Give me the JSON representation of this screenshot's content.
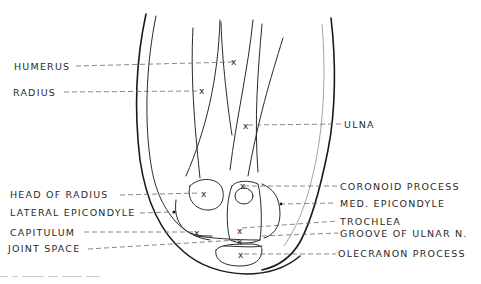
{
  "figure": {
    "type": "anatomical line drawing"
  },
  "labels_left": [
    {
      "id": "humerus",
      "text": "HUMERUS"
    },
    {
      "id": "radius",
      "text": "RADIUS"
    },
    {
      "id": "head-of-radius",
      "text": "HEAD OF RADIUS"
    },
    {
      "id": "lateral-epicondyle",
      "text": "LATERAL EPICONDYLE"
    },
    {
      "id": "capitulum",
      "text": "CAPITULUM"
    },
    {
      "id": "joint-space",
      "text": "JOINT SPACE"
    }
  ],
  "labels_right": [
    {
      "id": "ulna",
      "text": "ULNA"
    },
    {
      "id": "coronoid-process",
      "text": "CORONOID PROCESS"
    },
    {
      "id": "med-epicondyle",
      "text": "MED. EPICONDYLE"
    },
    {
      "id": "trochlea",
      "text": "TROCHLEA"
    },
    {
      "id": "groove-of-ulnar-n",
      "text": "GROOVE OF ULNAR N."
    },
    {
      "id": "olecranon-process",
      "text": "OLECRANON PROCESS"
    }
  ],
  "marker_glyph": "x",
  "colors": {
    "line": "#1a1a1a",
    "leader": "#6a6a6a",
    "text": "#2a2a2a",
    "background": "#ffffff"
  }
}
